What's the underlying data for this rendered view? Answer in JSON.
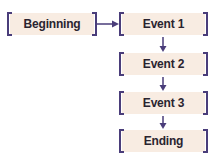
{
  "diagram": {
    "type": "flowchart",
    "nodes": [
      {
        "id": "beginning",
        "label": "Beginning"
      },
      {
        "id": "event1",
        "label": "Event 1"
      },
      {
        "id": "event2",
        "label": "Event 2"
      },
      {
        "id": "event3",
        "label": "Event 3"
      },
      {
        "id": "ending",
        "label": "Ending"
      }
    ],
    "edges": [
      {
        "from": "beginning",
        "to": "event1"
      },
      {
        "from": "event1",
        "to": "event2"
      },
      {
        "from": "event2",
        "to": "event3"
      },
      {
        "from": "event3",
        "to": "ending"
      }
    ],
    "colors": {
      "bracket": "#4a3d7a",
      "fill": "#f8ece2",
      "text": "#2a2430"
    }
  }
}
